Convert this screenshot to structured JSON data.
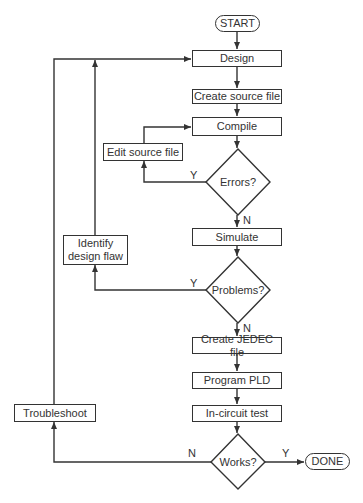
{
  "flowchart": {
    "terminals": {
      "start": "START",
      "done": "DONE"
    },
    "processes": {
      "design": "Design",
      "create_source": "Create source file",
      "compile": "Compile",
      "edit_source": "Edit source file",
      "simulate": "Simulate",
      "identify_flaw": "Identify design flaw",
      "create_jedec": "Create JEDEC file",
      "program_pld": "Program PLD",
      "in_circuit_test": "In-circuit test",
      "troubleshoot": "Troubleshoot"
    },
    "decisions": {
      "errors": "Errors?",
      "problems": "Problems?",
      "works": "Works?"
    },
    "edge_labels": {
      "errors_yes": "Y",
      "errors_no": "N",
      "problems_yes": "Y",
      "problems_no": "N",
      "works_yes": "Y",
      "works_no": "N"
    },
    "colors": {
      "line": "#333333",
      "background": "#ffffff"
    }
  }
}
